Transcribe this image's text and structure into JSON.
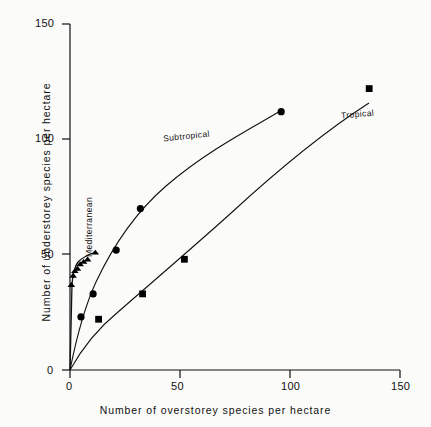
{
  "chart_data": {
    "type": "scatter",
    "title": "",
    "xlabel": "Number of overstorey species per hectare",
    "ylabel": "Number of understorey species per hectare",
    "xlim": [
      0,
      150
    ],
    "ylim": [
      0,
      150
    ],
    "xticks": [
      0,
      50,
      100,
      150
    ],
    "yticks": [
      0,
      50,
      100,
      150
    ],
    "grid": false,
    "legend_position": "inline-curve-labels",
    "series": [
      {
        "name": "Mediterranean",
        "marker": "triangle",
        "color": "#000000",
        "points": [
          [
            0.6,
            37
          ],
          [
            1.4,
            41
          ],
          [
            2.2,
            43
          ],
          [
            3.4,
            44
          ],
          [
            4.6,
            46
          ],
          [
            6.2,
            47
          ],
          [
            8.0,
            48
          ],
          [
            11.5,
            51
          ]
        ]
      },
      {
        "name": "Subtropical",
        "marker": "circle",
        "color": "#000000",
        "points": [
          [
            5.0,
            23
          ],
          [
            10.5,
            33
          ],
          [
            21.0,
            52
          ],
          [
            32.0,
            70
          ],
          [
            96.0,
            112
          ]
        ]
      },
      {
        "name": "Tropical",
        "marker": "square",
        "color": "#000000",
        "points": [
          [
            13.0,
            22
          ],
          [
            33.0,
            33
          ],
          [
            52.0,
            48
          ],
          [
            136.0,
            122
          ]
        ]
      }
    ]
  },
  "axes": {
    "x_ticks": [
      "0",
      "50",
      "100",
      "150"
    ],
    "y_ticks": [
      "0",
      "50",
      "100",
      "150"
    ],
    "x_title": "Number of overstorey species per hectare",
    "y_title": "Number of understorey species per hectare"
  },
  "curve_labels": {
    "mediterranean": "Mediterranean",
    "subtropical": "Subtropical",
    "tropical": "Tropical"
  },
  "style": {
    "line_color": "#111111",
    "marker_color": "#000000",
    "background": "#fbfbf9"
  }
}
